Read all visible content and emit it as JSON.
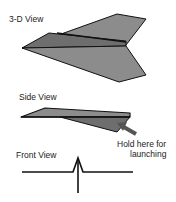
{
  "labels": {
    "view_3d": "3-D View",
    "view_side": "Side View",
    "view_front": "Front View",
    "hold_line1": "Hold here for",
    "hold_line2": "launching"
  },
  "colors": {
    "fill": "#8c8c8c",
    "fill_dark": "#6e6e6e",
    "stroke": "#111111",
    "arrow": "#555555"
  }
}
